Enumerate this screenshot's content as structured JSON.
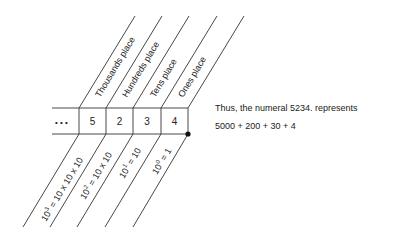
{
  "diagram": {
    "ellipsis": "• • •",
    "digits": [
      "5",
      "2",
      "3",
      "4"
    ],
    "place_labels": [
      "Thousands place",
      "Hundreds place",
      "Tens place",
      "Ones place"
    ],
    "powers": [
      {
        "base": "10",
        "exp": "3",
        "rest": " = 10 x 10 x 10"
      },
      {
        "base": "10",
        "exp": "2",
        "rest": " = 10 x 10"
      },
      {
        "base": "10",
        "exp": "1",
        "rest": " = 10"
      },
      {
        "base": "10",
        "exp": "0",
        "rest": " = 1"
      }
    ],
    "caption_line1": "Thus, the numeral 5234. represents",
    "caption_line2": "5000 + 200 + 30 + 4",
    "line_color": "#333333"
  }
}
